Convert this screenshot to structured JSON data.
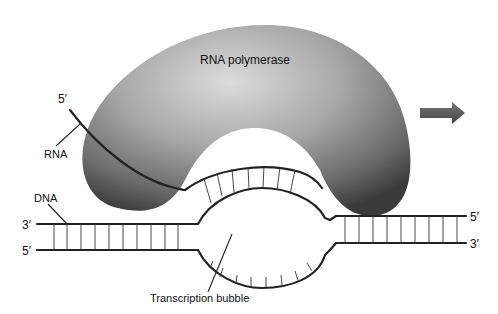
{
  "diagram": {
    "labels": {
      "enzyme": "RNA polymerase",
      "rna": "RNA",
      "rna_end": "5′",
      "dna": "DNA",
      "left_top_end": "3′",
      "left_bottom_end": "5′",
      "right_top_end": "5′",
      "right_bottom_end": "3′",
      "bubble": "Transcription bubble"
    },
    "direction_arrow": "right-arrow",
    "colors": {
      "enzyme_light": "#d9d9d9",
      "enzyme_dark": "#4a4a4a",
      "strand": "#222222",
      "arrow": "#555555",
      "background": "#ffffff"
    }
  }
}
